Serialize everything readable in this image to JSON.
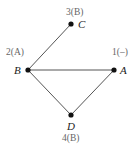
{
  "graph": {
    "nodes": [
      {
        "id": "A",
        "name": "A",
        "annotation": "1(–)",
        "x": 114,
        "y": 70
      },
      {
        "id": "B",
        "name": "B",
        "annotation": "2(A)",
        "x": 28,
        "y": 70
      },
      {
        "id": "C",
        "name": "C",
        "annotation": "3(B)",
        "x": 71,
        "y": 24
      },
      {
        "id": "D",
        "name": "D",
        "annotation": "4(B)",
        "x": 71,
        "y": 115
      }
    ],
    "edges": [
      {
        "from": "B",
        "to": "C"
      },
      {
        "from": "B",
        "to": "A"
      },
      {
        "from": "B",
        "to": "D"
      },
      {
        "from": "A",
        "to": "D"
      }
    ],
    "colors": {
      "edge": "#555555",
      "node": "#111111",
      "annotation": "#666666"
    }
  }
}
